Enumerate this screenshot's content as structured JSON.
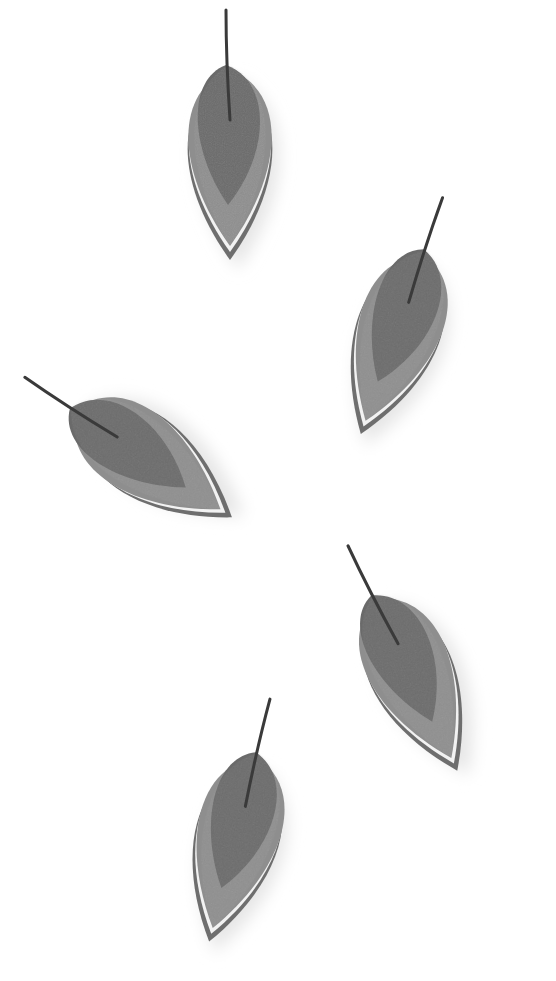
{
  "scene": {
    "description": "Five layered leaf-shaped sculptures with stems on a white background",
    "background": "#ffffff",
    "colors": {
      "leaf_dark": "#6a6a6a",
      "leaf_mid": "#8a8a8a",
      "leaf_light": "#a0a0a0",
      "layer_white": "#f2f2f2",
      "stem": "#3a3a3a",
      "shadow": "#e6e6e6"
    },
    "leaves": [
      {
        "id": "leaf-1",
        "cx": 230,
        "cy": 160,
        "rotate": 0
      },
      {
        "id": "leaf-2",
        "cx": 395,
        "cy": 340,
        "rotate": 20
      },
      {
        "id": "leaf-3",
        "cx": 150,
        "cy": 460,
        "rotate": -55
      },
      {
        "id": "leaf-4",
        "cx": 415,
        "cy": 680,
        "rotate": -25
      },
      {
        "id": "leaf-5",
        "cx": 235,
        "cy": 845,
        "rotate": 15
      }
    ]
  }
}
